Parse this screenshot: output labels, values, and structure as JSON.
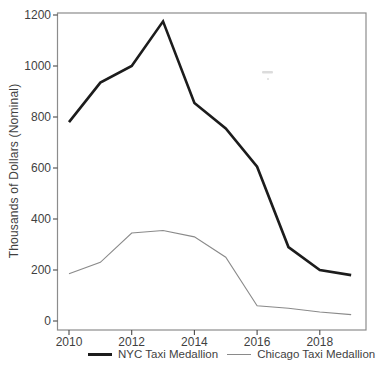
{
  "chart_data": {
    "type": "line",
    "title": "",
    "xlabel": "",
    "ylabel": "Thousands of Dollars (Nominal)",
    "x": [
      2010,
      2011,
      2012,
      2013,
      2014,
      2015,
      2016,
      2017,
      2018,
      2019
    ],
    "series": [
      {
        "name": "NYC Taxi Medallion",
        "color": "#1c1c1c",
        "stroke_width": 2.6,
        "values": [
          780,
          935,
          1000,
          1175,
          855,
          755,
          605,
          290,
          200,
          180
        ]
      },
      {
        "name": "Chicago Taxi Medallion",
        "color": "#8a8a8a",
        "stroke_width": 1.1,
        "values": [
          185,
          230,
          345,
          355,
          330,
          250,
          60,
          50,
          35,
          25
        ]
      }
    ],
    "xticks": [
      2010,
      2012,
      2014,
      2016,
      2018
    ],
    "yticks": [
      0,
      200,
      400,
      600,
      800,
      1000,
      1200
    ],
    "xlim": [
      2009.6,
      2019.45
    ],
    "ylim": [
      0,
      1200
    ],
    "grid": false,
    "legend_position": "bottom",
    "axis_color": "#8c8c8c",
    "tick_color": "#4a4a4a",
    "text_color": "#3f3f3f"
  }
}
